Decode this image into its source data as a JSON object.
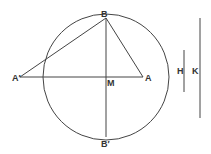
{
  "diagram": {
    "type": "geometry",
    "circle": {
      "cx": 106,
      "cy": 77,
      "r": 63
    },
    "points": {
      "B": {
        "label": "B",
        "x": 106,
        "y": 18
      },
      "B_prime": {
        "label": "B′",
        "x": 106,
        "y": 137
      },
      "A": {
        "label": "A",
        "x": 143,
        "y": 77
      },
      "A_prime": {
        "label": "A′",
        "x": 20,
        "y": 77
      },
      "M": {
        "label": "M",
        "x": 106,
        "y": 77
      }
    },
    "segments": [
      {
        "from": "A_prime",
        "to": "A",
        "name": "diameter-AA'"
      },
      {
        "from": "B",
        "to": "B_prime",
        "name": "chord-BB'"
      },
      {
        "from": "A_prime",
        "to": "B",
        "name": "segment-A'B"
      },
      {
        "from": "B",
        "to": "A",
        "name": "segment-BA"
      }
    ],
    "auxiliary_lines": [
      {
        "label": "H",
        "x": 184,
        "y1": 50,
        "y2": 92
      },
      {
        "label": "K",
        "x": 200,
        "y1": 18,
        "y2": 118
      }
    ]
  }
}
